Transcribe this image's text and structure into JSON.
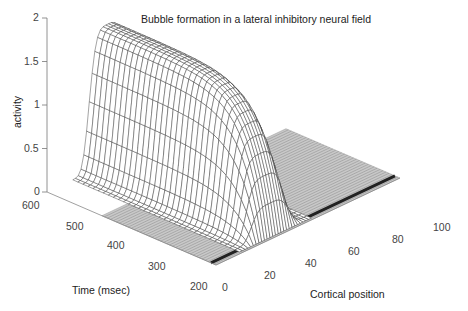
{
  "chart_data": {
    "type": "surface3d",
    "title": "Bubble formation in a lateral inhibitory neural field",
    "xlabel": "Cortical position",
    "ylabel": "Time (msec)",
    "zlabel": "activity",
    "x_ticks": [
      "0",
      "20",
      "40",
      "60",
      "80",
      "100"
    ],
    "y_ticks": [
      "200",
      "300",
      "400",
      "500",
      "600"
    ],
    "z_ticks": [
      "0",
      "0.5",
      "1",
      "1.5",
      "2"
    ],
    "xlim": [
      0,
      100
    ],
    "ylim": [
      200,
      600
    ],
    "zlim": [
      0,
      2
    ],
    "surface_samples": {
      "positions": [
        0,
        20,
        25,
        30,
        35,
        40,
        45,
        50,
        60,
        80,
        100
      ],
      "times": [
        200,
        250,
        300,
        400,
        500,
        600
      ],
      "activity": [
        [
          0,
          0,
          0.05,
          0.08,
          0.08,
          0.05,
          0,
          0,
          0,
          0,
          0
        ],
        [
          0,
          0,
          0.4,
          0.7,
          0.75,
          0.55,
          0.15,
          0,
          0,
          0,
          0
        ],
        [
          0,
          0,
          0.9,
          1.3,
          1.35,
          1.1,
          0.4,
          0,
          0,
          0,
          0
        ],
        [
          0,
          0,
          1.1,
          1.55,
          1.6,
          1.4,
          0.6,
          0,
          0,
          0,
          0
        ],
        [
          0,
          0,
          1.15,
          1.6,
          1.6,
          1.45,
          0.65,
          0,
          0,
          0,
          0
        ],
        [
          0,
          0,
          1.15,
          1.6,
          1.6,
          1.45,
          0.65,
          0,
          0,
          0,
          0
        ]
      ]
    },
    "grid": false,
    "legend": null
  },
  "labels": {
    "title": "Bubble formation in a lateral inhibitory neural field",
    "xlabel": "Cortical position",
    "ylabel": "Time (msec)",
    "zlabel": "activity"
  }
}
